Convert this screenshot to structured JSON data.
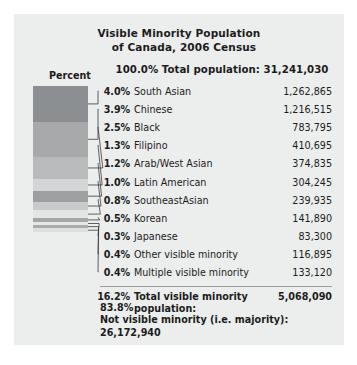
{
  "chart_data": {
    "type": "bar",
    "title": "Visible Minority Population of Canada, 2006 Census",
    "title_line1": "Visible Minority Population",
    "title_line2": "of Canada, 2006 Census",
    "axis_caption": "Percent",
    "header": {
      "percent": "100.0%",
      "label": "Total population: 31,241,030",
      "full": "100.0% Total population: 31,241,030"
    },
    "categories": [
      "South Asian",
      "Chinese",
      "Black",
      "Filipino",
      "Arab/West Asian",
      "Latin American",
      "SoutheastAsian",
      "Korean",
      "Japanese",
      "Other visible minority",
      "Multiple visible minority"
    ],
    "values": [
      4.0,
      3.9,
      2.5,
      1.3,
      1.2,
      1.0,
      0.8,
      0.5,
      0.3,
      0.4,
      0.4
    ],
    "counts": [
      1262865,
      1216515,
      783795,
      410695,
      374835,
      304245,
      239935,
      141890,
      83300,
      116895,
      133120
    ],
    "xlabel": "",
    "ylabel": "Percent",
    "legend": "none",
    "grid": false,
    "rows": [
      {
        "percent": "4.0%",
        "name": "South Asian",
        "value": "1,262,865",
        "color": "#8c8f91",
        "share": 4.0
      },
      {
        "percent": "3.9%",
        "name": "Chinese",
        "value": "1,216,515",
        "color": "#a7a9ab",
        "share": 3.9
      },
      {
        "percent": "2.5%",
        "name": "Black",
        "value": "783,795",
        "color": "#b9babb",
        "share": 2.5
      },
      {
        "percent": "1.3%",
        "name": "Filipino",
        "value": "410,695",
        "color": "#d4d5d6",
        "share": 1.3
      },
      {
        "percent": "1.2%",
        "name": "Arab/West Asian",
        "value": "374,835",
        "color": "#9d9fa1",
        "share": 1.2
      },
      {
        "percent": "1.0%",
        "name": "Latin American",
        "value": "304,245",
        "color": "#c9cacb",
        "share": 1.0
      },
      {
        "percent": "0.8%",
        "name": "SoutheastAsian",
        "value": "239,935",
        "color": "#e3e4e4",
        "share": 0.8
      },
      {
        "percent": "0.5%",
        "name": "Korean",
        "value": "141,890",
        "color": "#a3a5a7",
        "share": 0.5
      },
      {
        "percent": "0.3%",
        "name": "Japanese",
        "value": "83,300",
        "color": "#e6e7e7",
        "share": 0.3
      },
      {
        "percent": "0.4%",
        "name": "Other visible minority",
        "value": "116,895",
        "color": "#a8aaac",
        "share": 0.4
      },
      {
        "percent": "0.4%",
        "name": "Multiple visible minority",
        "value": "133,120",
        "color": "#dcdddd",
        "share": 0.4
      }
    ],
    "total_row": {
      "percent": "16.2%",
      "name": "Total visible minority",
      "name_line2": "population:",
      "value": "5,068,090"
    },
    "footer": {
      "percent": "83.8%",
      "label": "Not visible minority (i.e. majority):",
      "value": "26,172,940"
    }
  }
}
